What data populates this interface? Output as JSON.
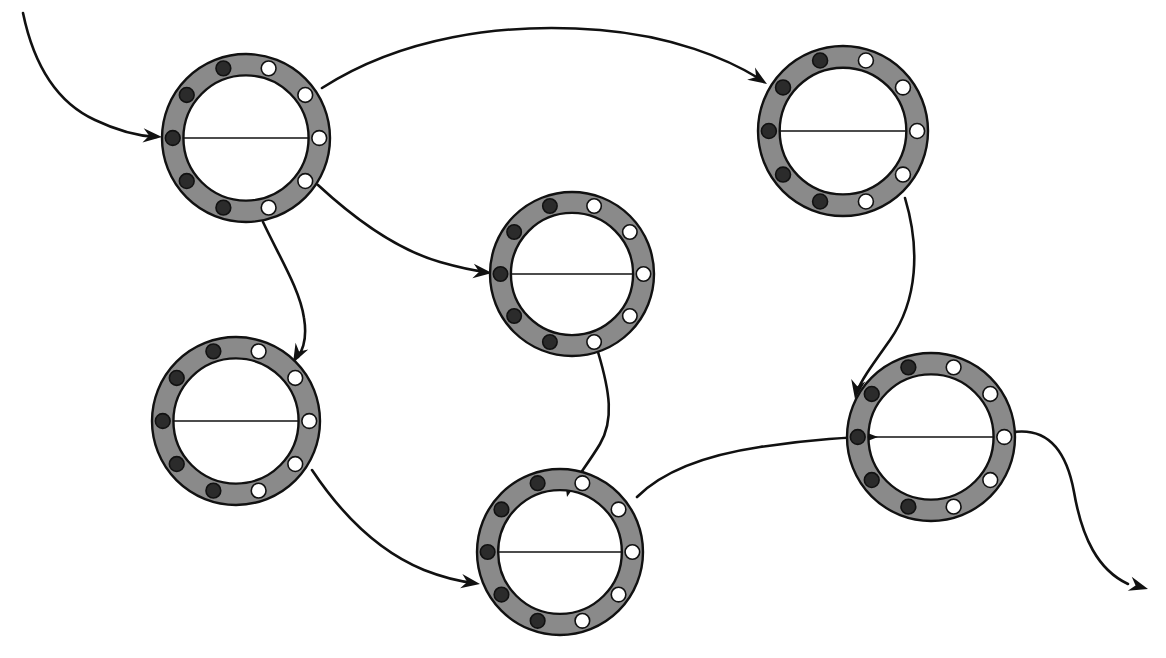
{
  "canvas": {
    "width": 1166,
    "height": 658,
    "background": "#ffffff",
    "title": "Directed graph of ten-position ring nodes"
  },
  "style": {
    "ring_fill": "#8a8a8a",
    "ring_stroke": "#111111",
    "ring_stroke_width": 2.4,
    "dark_dot_fill": "#2b2b2b",
    "dark_dot_stroke": "#111111",
    "white_dot_fill": "#ffffff",
    "white_dot_stroke": "#111111",
    "dot_stroke_width": 1.6,
    "diameter_line_color": "#111111",
    "diameter_line_width": 1.3,
    "edge_color": "#111111",
    "edge_width": 2.6,
    "arrowhead_color": "#111111"
  },
  "ring_geometry": {
    "outer_radius_ratio": 1.0,
    "inner_radius_ratio": 0.745,
    "dot_orbit_ratio": 0.872,
    "dot_radius_ratio": 0.088,
    "dot_count": 10,
    "dark_dot_count": 5,
    "white_dot_count": 5,
    "dot_angles_deg": [
      180,
      144,
      108,
      72,
      36,
      0,
      324,
      288,
      252,
      216
    ],
    "dot_colors": [
      "dark",
      "dark",
      "dark",
      "white",
      "white",
      "white",
      "white",
      "white",
      "dark",
      "dark"
    ],
    "has_diameter_line": true
  },
  "nodes": [
    {
      "id": "n1",
      "label": "node-top-left",
      "cx": 246,
      "cy": 138,
      "r": 84
    },
    {
      "id": "n2",
      "label": "node-top-right",
      "cx": 843,
      "cy": 131,
      "r": 85
    },
    {
      "id": "n3",
      "label": "node-middle-center",
      "cx": 572,
      "cy": 274,
      "r": 82
    },
    {
      "id": "n4",
      "label": "node-left-lower",
      "cx": 236,
      "cy": 421,
      "r": 84
    },
    {
      "id": "n5",
      "label": "node-bottom-center",
      "cx": 560,
      "cy": 552,
      "r": 83
    },
    {
      "id": "n6",
      "label": "node-right-lower",
      "cx": 931,
      "cy": 437,
      "r": 84
    }
  ],
  "edges": [
    {
      "id": "e0",
      "label": "entry-arrow-into-top-left",
      "from": "external-start",
      "to": "n1",
      "path": "M 23,13 C 34,66 58,103 95,120 C 118,131 140,136 156,137",
      "arrow_at": {
        "x": 162,
        "y": 137,
        "angle_deg": 5
      }
    },
    {
      "id": "e1",
      "label": "edge-top-left-to-top-right",
      "from": "n1",
      "to": "n2",
      "path": "M 322,88 C 400,38 500,22 600,30 C 672,36 726,58 760,79",
      "arrow_at": {
        "x": 767,
        "y": 84,
        "angle_deg": 33
      }
    },
    {
      "id": "e2",
      "label": "edge-top-left-to-middle-center",
      "from": "n1",
      "to": "n3",
      "path": "M 318,185 C 358,222 398,250 440,262 C 461,268 477,271 486,272",
      "arrow_at": {
        "x": 492,
        "y": 273,
        "angle_deg": 6
      }
    },
    {
      "id": "e3",
      "label": "edge-top-left-to-left-lower",
      "from": "n1",
      "to": "n4",
      "path": "M 263,222 C 280,258 300,290 304,318 C 307,336 304,348 298,357",
      "arrow_at": {
        "x": 293,
        "y": 363,
        "angle_deg": 118
      }
    },
    {
      "id": "e4",
      "label": "edge-top-right-to-right-lower",
      "from": "n2",
      "to": "n6",
      "path": "M 905,198 C 920,248 918,300 890,340 C 873,364 861,380 857,392",
      "arrow_at": {
        "x": 855,
        "y": 399,
        "angle_deg": 100
      }
    },
    {
      "id": "e5",
      "label": "edge-middle-center-to-bottom-center",
      "from": "n3",
      "to": "n5",
      "path": "M 598,352 C 610,392 614,420 600,444 C 588,464 576,478 570,490",
      "arrow_at": {
        "x": 567,
        "y": 497,
        "angle_deg": 104
      }
    },
    {
      "id": "e6",
      "label": "edge-left-lower-to-bottom-center",
      "from": "n4",
      "to": "n5",
      "path": "M 312,470 C 344,518 380,552 424,570 C 447,579 465,582 474,583",
      "arrow_at": {
        "x": 480,
        "y": 584,
        "angle_deg": 9
      }
    },
    {
      "id": "e7",
      "label": "edge-bottom-center-to-right-lower",
      "from": "n5",
      "to": "n6",
      "path": "M 637,497 C 660,474 700,456 760,447 C 812,439 855,437 871,437",
      "arrow_at": {
        "x": 878,
        "y": 437,
        "angle_deg": 0
      }
    },
    {
      "id": "e8",
      "label": "exit-arrow-from-right-lower",
      "from": "n6",
      "to": "external-end",
      "path": "M 1014,432 C 1046,428 1066,448 1074,492 C 1082,538 1098,570 1128,584",
      "arrow_at": {
        "x": 1148,
        "y": 589,
        "angle_deg": 16
      }
    }
  ]
}
